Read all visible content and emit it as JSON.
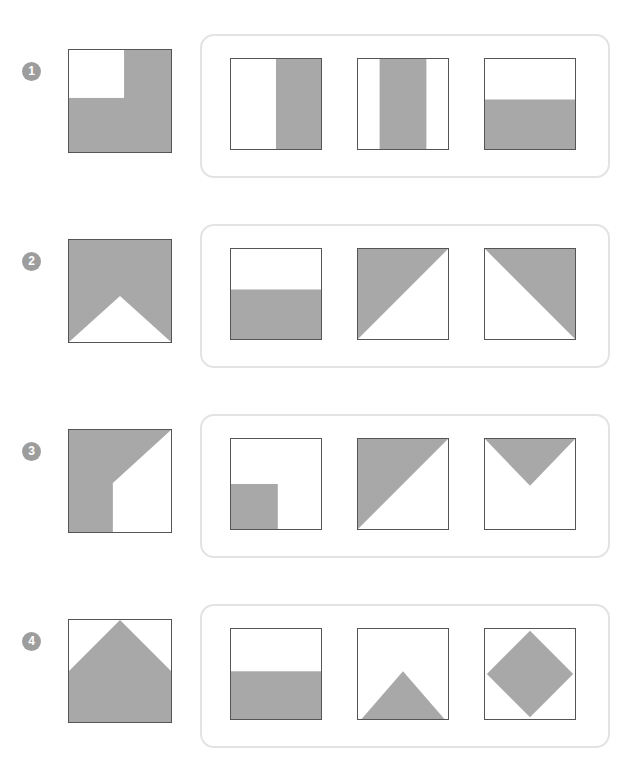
{
  "page": {
    "background_color": "#ffffff",
    "shape_fill_color": "#a8a8a8",
    "shape_stroke_color": "#555555",
    "panel_border_color": "#e3e3e3",
    "badge_color": "#9d9d9d"
  },
  "rows": [
    {
      "number": "1",
      "badge_name": "row-number-1",
      "prompt": {
        "name": "prompt-square-notched",
        "description": "square with white notch cut from top-left corner",
        "shape": "notch-top-left"
      },
      "options": [
        {
          "name": "option-right-half-vertical",
          "description": "right half shaded vertically",
          "shape": "right-half"
        },
        {
          "name": "option-center-vertical-band",
          "description": "center vertical band shaded",
          "shape": "center-band-vertical"
        },
        {
          "name": "option-bottom-band",
          "description": "bottom portion shaded horizontally",
          "shape": "bottom-band"
        }
      ]
    },
    {
      "number": "2",
      "badge_name": "row-number-2",
      "prompt": {
        "name": "prompt-square-white-up-triangle",
        "description": "shaded square with white triangle rising from the bottom edge",
        "shape": "white-up-triangle"
      },
      "options": [
        {
          "name": "option-bottom-band",
          "description": "bottom portion shaded horizontally",
          "shape": "bottom-band"
        },
        {
          "name": "option-upper-left-triangle",
          "description": "upper-left triangle shaded",
          "shape": "upper-left-triangle"
        },
        {
          "name": "option-upper-right-triangle",
          "description": "upper-right triangle shaded",
          "shape": "upper-right-triangle"
        }
      ]
    },
    {
      "number": "3",
      "badge_name": "row-number-3",
      "prompt": {
        "name": "prompt-left-band-diagonal",
        "description": "left band shaded with diagonal cut from top-right to middle-left",
        "shape": "left-band-diagonal"
      },
      "options": [
        {
          "name": "option-bottom-left-rectangle",
          "description": "small rectangle shaded at bottom-left",
          "shape": "bottom-left-rectangle"
        },
        {
          "name": "option-upper-left-triangle",
          "description": "upper-left triangle shaded",
          "shape": "upper-left-triangle"
        },
        {
          "name": "option-down-triangle",
          "description": "downward-pointing triangle shaded at top",
          "shape": "down-triangle"
        }
      ]
    },
    {
      "number": "4",
      "badge_name": "row-number-4",
      "prompt": {
        "name": "prompt-house-pentagon",
        "description": "house shaped pentagon shaded with white triangles at the top corners",
        "shape": "house-pentagon"
      },
      "options": [
        {
          "name": "option-bottom-half",
          "description": "bottom half shaded horizontally",
          "shape": "bottom-half"
        },
        {
          "name": "option-up-triangle",
          "description": "upward-pointing triangle shaded at the bottom",
          "shape": "up-triangle"
        },
        {
          "name": "option-diamond",
          "description": "diamond shaded in the center",
          "shape": "diamond"
        }
      ]
    }
  ]
}
